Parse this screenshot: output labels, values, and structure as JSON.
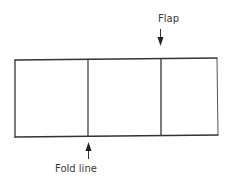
{
  "diagram": {
    "type": "folding-template",
    "labels": {
      "flap": "Flap",
      "fold_line": "Fold line"
    },
    "panels": [
      {
        "name": "left-panel"
      },
      {
        "name": "middle-panel"
      },
      {
        "name": "flap-panel"
      }
    ],
    "colors": {
      "line": "#333333",
      "text": "#3a3a3a",
      "background": "#ffffff"
    }
  }
}
